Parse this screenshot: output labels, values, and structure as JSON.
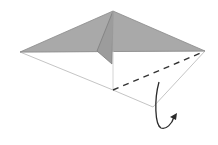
{
  "diagram": {
    "type": "origami-fold-step",
    "colors": {
      "background": "#ffffff",
      "colored_side": "#a9a9a9",
      "flap_shade": "#9c9c9c",
      "white_side": "#ffffff",
      "edge": "#8a8a8a",
      "fold_line": "#333333",
      "arrow": "#2b2b2b"
    },
    "points": {
      "apex": [
        113,
        11
      ],
      "left": [
        20,
        52
      ],
      "right": [
        205,
        51
      ],
      "center_bottom": [
        113,
        90
      ],
      "bottom": [
        153,
        107
      ],
      "flap_elbow": [
        97,
        51
      ],
      "flap_tip": [
        112,
        64
      ]
    },
    "fold_line": {
      "style": "dashed",
      "from": [
        113,
        90
      ],
      "to": [
        203,
        52
      ]
    },
    "arrow": {
      "kind": "fold-behind",
      "direction": "up-right"
    }
  }
}
